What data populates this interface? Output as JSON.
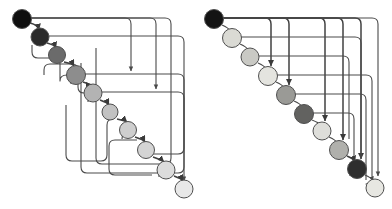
{
  "figure": {
    "background_color": "#ffffff",
    "edge_color": "#4a4a4a",
    "node_stroke_color": "#4f4f4f",
    "width": 392,
    "height": 209,
    "faint_caption": ""
  },
  "chart_data": {
    "type": "diagram",
    "title": "",
    "xlabel": "",
    "ylabel": "",
    "panels": [
      {
        "name": "left-panel",
        "label": "",
        "node_count": 10,
        "nodes": [
          {
            "id": "L1",
            "index": 1,
            "cx": 22,
            "cy": 19,
            "r": 9.5,
            "fill": "#0f0f0f",
            "shade_label": "black"
          },
          {
            "id": "L2",
            "index": 2,
            "cx": 40,
            "cy": 37,
            "r": 9.0,
            "fill": "#2b2b2b",
            "shade_label": "near-black"
          },
          {
            "id": "L3",
            "index": 3,
            "cx": 57,
            "cy": 55,
            "r": 8.5,
            "fill": "#6b6b6b",
            "shade_label": "dark-gray"
          },
          {
            "id": "L4",
            "index": 4,
            "cx": 76,
            "cy": 75,
            "r": 9.5,
            "fill": "#8d8d8d",
            "shade_label": "mid-gray"
          },
          {
            "id": "L5",
            "index": 5,
            "cx": 93,
            "cy": 93,
            "r": 9.0,
            "fill": "#b3b3b3",
            "shade_label": "light-gray"
          },
          {
            "id": "L6",
            "index": 6,
            "cx": 110,
            "cy": 112,
            "r": 8.0,
            "fill": "#c2c2c2",
            "shade_label": "light-gray"
          },
          {
            "id": "L7",
            "index": 7,
            "cx": 128,
            "cy": 130,
            "r": 8.5,
            "fill": "#cecece",
            "shade_label": "lighter-gray"
          },
          {
            "id": "L8",
            "index": 8,
            "cx": 146,
            "cy": 150,
            "r": 8.5,
            "fill": "#d4d4d4",
            "shade_label": "lighter-gray"
          },
          {
            "id": "L9",
            "index": 9,
            "cx": 166,
            "cy": 170,
            "r": 9.0,
            "fill": "#dcdcdc",
            "shade_label": "near-white"
          },
          {
            "id": "L10",
            "index": 10,
            "cx": 184,
            "cy": 189,
            "r": 9.0,
            "fill": "#e8e8e8",
            "shade_label": "near-white"
          }
        ],
        "edges": [
          {
            "from": "L1",
            "to": "L2",
            "kind": "short-hook"
          },
          {
            "from": "L2",
            "to": "L3",
            "kind": "short-hook"
          },
          {
            "from": "L3",
            "to": "L4",
            "kind": "short-hook"
          },
          {
            "from": "L4",
            "to": "L5",
            "kind": "short-hook"
          },
          {
            "from": "L5",
            "to": "L6",
            "kind": "short-hook"
          },
          {
            "from": "L6",
            "to": "L7",
            "kind": "short-hook"
          },
          {
            "from": "L7",
            "to": "L8",
            "kind": "short-hook"
          },
          {
            "from": "L8",
            "to": "L9",
            "kind": "short-hook"
          },
          {
            "from": "L9",
            "to": "L10",
            "kind": "short-hook"
          },
          {
            "from": "L1",
            "to": "L4",
            "kind": "right-loop"
          },
          {
            "from": "L1",
            "to": "L5",
            "kind": "right-loop"
          },
          {
            "from": "L2",
            "to": "L9",
            "kind": "right-loop"
          },
          {
            "from": "L4",
            "to": "L9",
            "kind": "right-loop"
          },
          {
            "from": "L5",
            "to": "L10",
            "kind": "right-loop"
          },
          {
            "from": "L4",
            "to": "L2",
            "kind": "left-back-loop"
          },
          {
            "from": "L5",
            "to": "L3",
            "kind": "left-back-loop"
          },
          {
            "from": "L9",
            "to": "L6",
            "kind": "left-back-loop"
          },
          {
            "from": "L8",
            "to": "L7",
            "kind": "left-back-loop"
          }
        ]
      },
      {
        "name": "right-panel",
        "label": "",
        "node_count": 10,
        "nodes": [
          {
            "id": "R1",
            "index": 1,
            "cx": 214,
            "cy": 19,
            "r": 9.5,
            "fill": "#141414",
            "shade_label": "black"
          },
          {
            "id": "R2",
            "index": 2,
            "cx": 232,
            "cy": 38,
            "r": 9.5,
            "fill": "#dadad4",
            "shade_label": "near-white"
          },
          {
            "id": "R3",
            "index": 3,
            "cx": 250,
            "cy": 57,
            "r": 9.0,
            "fill": "#c9c9c4",
            "shade_label": "lighter-gray"
          },
          {
            "id": "R4",
            "index": 4,
            "cx": 268,
            "cy": 76,
            "r": 9.5,
            "fill": "#e4e4df",
            "shade_label": "near-white"
          },
          {
            "id": "R5",
            "index": 5,
            "cx": 286,
            "cy": 95,
            "r": 9.5,
            "fill": "#9a9a96",
            "shade_label": "mid-gray"
          },
          {
            "id": "R6",
            "index": 6,
            "cx": 304,
            "cy": 114,
            "r": 9.5,
            "fill": "#626260",
            "shade_label": "dark-gray"
          },
          {
            "id": "R7",
            "index": 7,
            "cx": 322,
            "cy": 131,
            "r": 9.0,
            "fill": "#dededa",
            "shade_label": "near-white"
          },
          {
            "id": "R8",
            "index": 8,
            "cx": 339,
            "cy": 150,
            "r": 9.5,
            "fill": "#b0b0ac",
            "shade_label": "light-gray"
          },
          {
            "id": "R9",
            "index": 9,
            "cx": 357,
            "cy": 169,
            "r": 9.5,
            "fill": "#2e2e2e",
            "shade_label": "near-black"
          },
          {
            "id": "R10",
            "index": 10,
            "cx": 375,
            "cy": 188,
            "r": 9.0,
            "fill": "#e7e7e2",
            "shade_label": "near-white"
          }
        ],
        "edges": [
          {
            "from": "R1",
            "to": "R4",
            "kind": "down-arrow"
          },
          {
            "from": "R1",
            "to": "R5",
            "kind": "down-arrow"
          },
          {
            "from": "R1",
            "to": "R7",
            "kind": "down-arrow"
          },
          {
            "from": "R1",
            "to": "R8",
            "kind": "down-arrow"
          },
          {
            "from": "R1",
            "to": "R9",
            "kind": "right-loop"
          },
          {
            "from": "R2",
            "to": "R9",
            "kind": "right-loop"
          },
          {
            "from": "R3",
            "to": "R8",
            "kind": "right-loop"
          },
          {
            "from": "R4",
            "to": "R10",
            "kind": "right-loop"
          },
          {
            "from": "R5",
            "to": "R10",
            "kind": "right-loop"
          },
          {
            "from": "R6",
            "to": "R9",
            "kind": "right-loop"
          },
          {
            "from": "R7",
            "to": "R9",
            "kind": "short-hook"
          },
          {
            "from": "R9",
            "to": "R10",
            "kind": "short-hook"
          }
        ]
      }
    ],
    "legend": [],
    "annotations": []
  }
}
